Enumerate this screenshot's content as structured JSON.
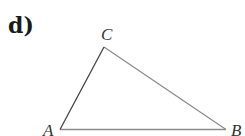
{
  "part_label": "d)",
  "triangle": {
    "vertices": [
      {
        "name": "A",
        "x": 60,
        "y": 129
      },
      {
        "name": "B",
        "x": 226,
        "y": 129
      },
      {
        "name": "C",
        "x": 104,
        "y": 47
      }
    ],
    "labels": {
      "A": "A",
      "B": "B",
      "C": "C"
    },
    "stroke_color": "#8a8a8a",
    "edge_ac_color": "#444444"
  }
}
